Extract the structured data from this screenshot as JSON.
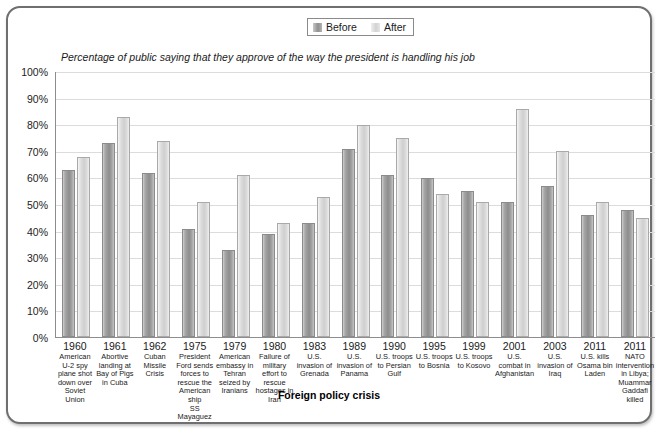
{
  "legend": {
    "items": [
      {
        "label": "Before",
        "color": "#8f8f8f",
        "icon": "legend-swatch"
      },
      {
        "label": "After",
        "color": "#d2d2d2",
        "icon": "legend-swatch"
      }
    ]
  },
  "chart_data": {
    "type": "bar",
    "title": "",
    "subtitle": "Percentage of public saying that they approve of the way the president is handling his job",
    "xlabel": "Foreign policy crisis",
    "ylabel": "",
    "ylim": [
      0,
      100
    ],
    "ytick_labels": [
      "100%",
      "90%",
      "80%",
      "70%",
      "60%",
      "50%",
      "40%",
      "30%",
      "20%",
      "10%",
      "0%"
    ],
    "yticks": [
      100,
      90,
      80,
      70,
      60,
      50,
      40,
      30,
      20,
      10,
      0
    ],
    "grid": true,
    "legend_position": "top-center",
    "categories": [
      "1960 American U-2 spy plane shot down over Soviet Union",
      "1961 Abortive landing at Bay of Pigs in Cuba",
      "1962 Cuban Missile Crisis",
      "1975 President Ford sends forces to rescue the American ship SS Mayaguez",
      "1979 American embassy in Tehran seized by Iranians",
      "1980 Failure of military effort to rescue hostages in Iran",
      "1983 U.S. invasion of Grenada",
      "1989 U.S. invasion of Panama",
      "1990 U.S. troops to Persian Gulf",
      "1995 U.S. troops to Bosnia",
      "1999 U.S. troops to Kosovo",
      "2001 U.S. combat in Afghanistan",
      "2003 U.S. invasion of Iraq",
      "2011 U.S. kills Osama bin Laden",
      "2011 NATO intervention in Libya; Muammar Gaddafi killed"
    ],
    "category_details": [
      {
        "year": "1960",
        "desc": "American U-2 spy plane shot down over Soviet Union",
        "italic": ""
      },
      {
        "year": "1961",
        "desc": "Abortive landing at Bay of Pigs in Cuba",
        "italic": ""
      },
      {
        "year": "1962",
        "desc": "Cuban Missile Crisis",
        "italic": ""
      },
      {
        "year": "1975",
        "desc": "President Ford sends forces to rescue the American ship",
        "italic": "SS Mayaguez"
      },
      {
        "year": "1979",
        "desc": "American embassy in Tehran seized by Iranians",
        "italic": ""
      },
      {
        "year": "1980",
        "desc": "Failure of military effort to rescue hostages in Iran",
        "italic": ""
      },
      {
        "year": "1983",
        "desc": "U.S. invasion of Grenada",
        "italic": ""
      },
      {
        "year": "1989",
        "desc": "U.S. invasion of Panama",
        "italic": ""
      },
      {
        "year": "1990",
        "desc": "U.S. troops to Persian Gulf",
        "italic": ""
      },
      {
        "year": "1995",
        "desc": "U.S. troops to Bosnia",
        "italic": ""
      },
      {
        "year": "1999",
        "desc": "U.S. troops to Kosovo",
        "italic": ""
      },
      {
        "year": "2001",
        "desc": "U.S. combat in Afghanistan",
        "italic": ""
      },
      {
        "year": "2003",
        "desc": "U.S. invasion of Iraq",
        "italic": ""
      },
      {
        "year": "2011",
        "desc": "U.S. kills Osama bin Laden",
        "italic": ""
      },
      {
        "year": "2011",
        "desc": "NATO intervention in Libya; Muammar Gaddafi killed",
        "italic": ""
      }
    ],
    "series": [
      {
        "name": "Before",
        "color": "#8f8f8f",
        "values": [
          62,
          72,
          61,
          40,
          32,
          38,
          42,
          70,
          60,
          59,
          54,
          50,
          56,
          45,
          47
        ]
      },
      {
        "name": "After",
        "color": "#d2d2d2",
        "values": [
          67,
          82,
          73,
          50,
          60,
          42,
          52,
          79,
          74,
          53,
          50,
          85,
          69,
          50,
          44
        ]
      }
    ]
  }
}
